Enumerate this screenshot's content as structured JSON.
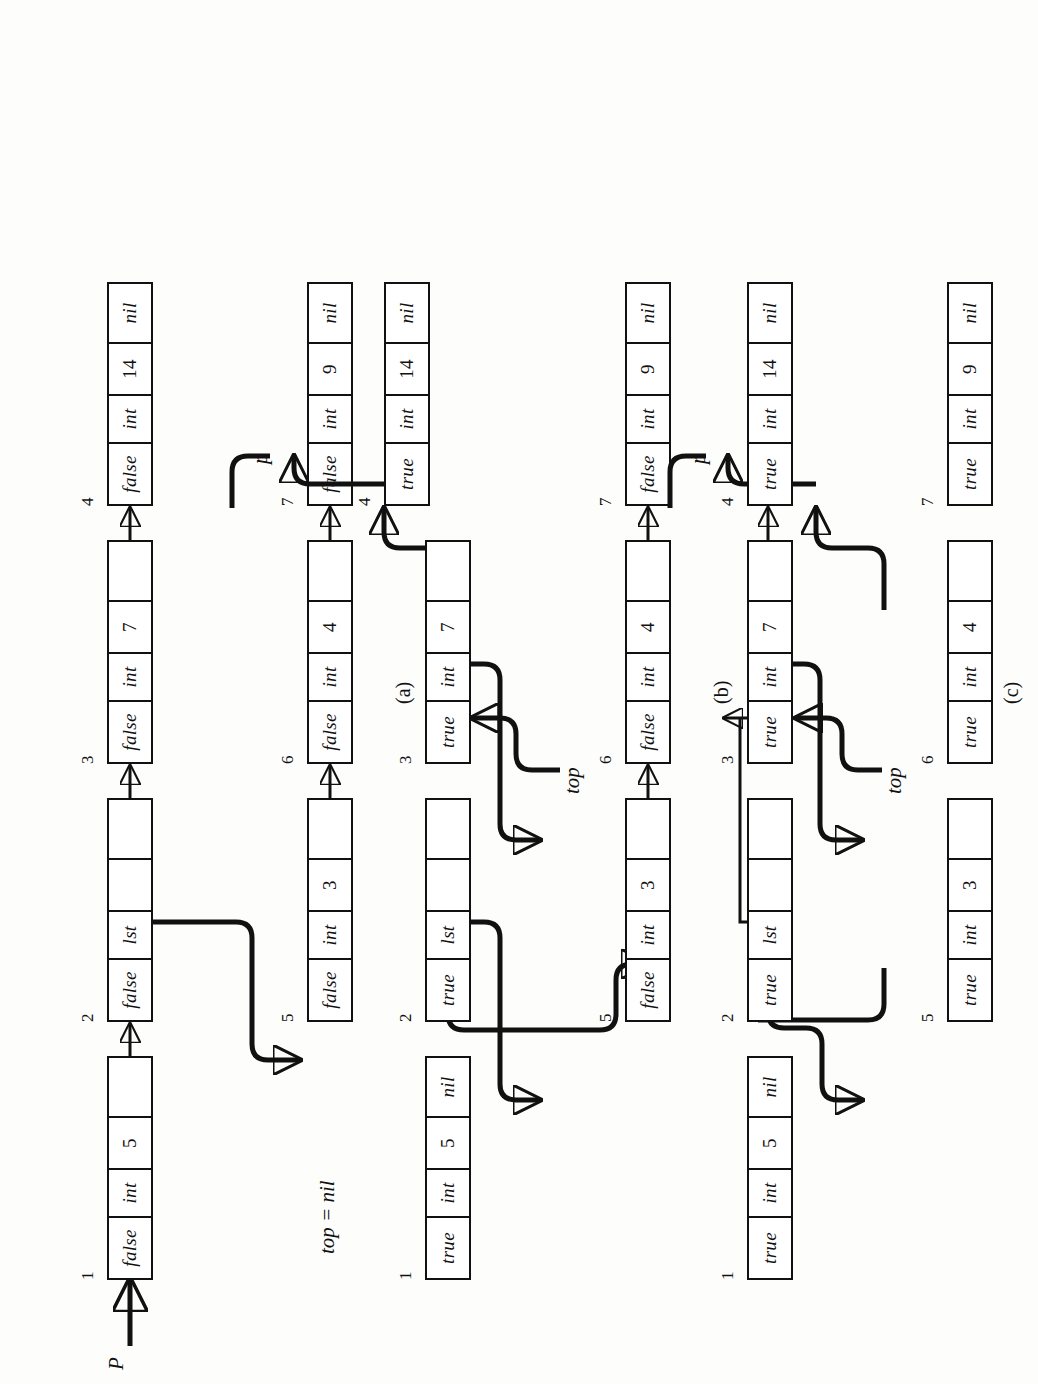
{
  "figure": {
    "panels": [
      {
        "id": "a",
        "label": "(a)",
        "note": "top = nil",
        "pointers": [
          {
            "name": "P",
            "target_node": "1"
          }
        ],
        "nodes": [
          {
            "id": "1",
            "mark": "false",
            "type": "int",
            "value": "5",
            "link": ""
          },
          {
            "id": "2",
            "mark": "false",
            "type": "lst",
            "value": "",
            "link": ""
          },
          {
            "id": "3",
            "mark": "false",
            "type": "int",
            "value": "7",
            "link": ""
          },
          {
            "id": "4",
            "mark": "false",
            "type": "int",
            "value": "14",
            "link": "nil"
          },
          {
            "id": "5",
            "mark": "false",
            "type": "int",
            "value": "3",
            "link": ""
          },
          {
            "id": "6",
            "mark": "false",
            "type": "int",
            "value": "4",
            "link": ""
          },
          {
            "id": "7",
            "mark": "false",
            "type": "int",
            "value": "9",
            "link": "nil"
          }
        ],
        "edges": [
          {
            "from": "1",
            "to": "2"
          },
          {
            "from": "2",
            "to": "3"
          },
          {
            "from": "3",
            "to": "4"
          },
          {
            "from": "2",
            "to": "5"
          },
          {
            "from": "5",
            "to": "6"
          },
          {
            "from": "6",
            "to": "7"
          }
        ]
      },
      {
        "id": "b",
        "label": "(b)",
        "note": "",
        "pointers": [
          {
            "name": "top",
            "target_node": "3"
          },
          {
            "name": "p",
            "target_node": "4"
          }
        ],
        "nodes": [
          {
            "id": "1",
            "mark": "true",
            "type": "int",
            "value": "5",
            "link": "nil"
          },
          {
            "id": "2",
            "mark": "true",
            "type": "lst",
            "value": "",
            "link": ""
          },
          {
            "id": "3",
            "mark": "true",
            "type": "int",
            "value": "7",
            "link": ""
          },
          {
            "id": "4",
            "mark": "true",
            "type": "int",
            "value": "14",
            "link": "nil"
          },
          {
            "id": "5",
            "mark": "false",
            "type": "int",
            "value": "3",
            "link": ""
          },
          {
            "id": "6",
            "mark": "false",
            "type": "int",
            "value": "4",
            "link": ""
          },
          {
            "id": "7",
            "mark": "false",
            "type": "int",
            "value": "9",
            "link": "nil"
          }
        ],
        "edges": [
          {
            "from": "2",
            "to": "1"
          },
          {
            "from": "3",
            "to": "2"
          },
          {
            "from": "3",
            "to": "4"
          },
          {
            "from": "2",
            "to": "5"
          },
          {
            "from": "5",
            "to": "6"
          },
          {
            "from": "6",
            "to": "7"
          }
        ]
      },
      {
        "id": "c",
        "label": "(c)",
        "note": "",
        "pointers": [
          {
            "name": "top",
            "target_node": "6"
          },
          {
            "name": "p",
            "target_node": "7"
          }
        ],
        "nodes": [
          {
            "id": "1",
            "mark": "true",
            "type": "int",
            "value": "5",
            "link": "nil"
          },
          {
            "id": "2",
            "mark": "true",
            "type": "lst",
            "value": "",
            "link": ""
          },
          {
            "id": "3",
            "mark": "true",
            "type": "int",
            "value": "7",
            "link": ""
          },
          {
            "id": "4",
            "mark": "true",
            "type": "int",
            "value": "14",
            "link": "nil"
          },
          {
            "id": "5",
            "mark": "true",
            "type": "int",
            "value": "3",
            "link": ""
          },
          {
            "id": "6",
            "mark": "true",
            "type": "int",
            "value": "4",
            "link": ""
          },
          {
            "id": "7",
            "mark": "true",
            "type": "int",
            "value": "9",
            "link": "nil"
          }
        ],
        "edges": [
          {
            "from": "2",
            "to": "1"
          },
          {
            "from": "2",
            "to": "3"
          },
          {
            "from": "3",
            "to": "4"
          },
          {
            "from": "6",
            "to": "5"
          },
          {
            "from": "5",
            "to": "2"
          },
          {
            "from": "6",
            "to": "7"
          }
        ]
      }
    ]
  }
}
